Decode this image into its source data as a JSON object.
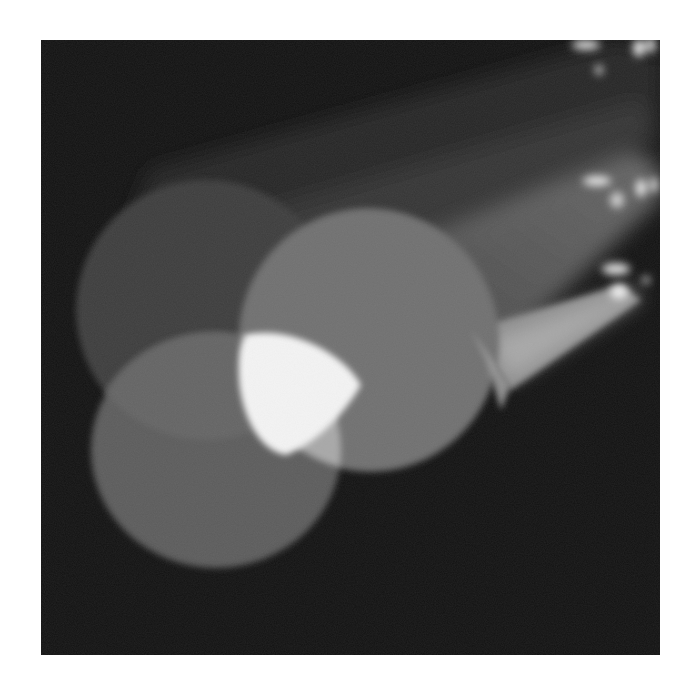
{
  "image": {
    "subject": "Three overlapping stage spotlight beams on a dark background",
    "tone": "grayscale",
    "colors": {
      "page_background": "#ffffff",
      "backdrop": "#121212",
      "beam_dim": "#3a3a3a",
      "beam_mid": "#5e5e5e",
      "beam_light": "#8a8a8a",
      "overlap_bright": "#f4f4f4",
      "overlap_mid": "#b8b8b8",
      "fixture_highlight": "#e8e8e8"
    },
    "spotlights": [
      {
        "label": "upper spotlight",
        "fixture_position": "top-right"
      },
      {
        "label": "middle spotlight",
        "fixture_position": "right"
      },
      {
        "label": "lower spotlight",
        "fixture_position": "right-middle"
      }
    ]
  }
}
